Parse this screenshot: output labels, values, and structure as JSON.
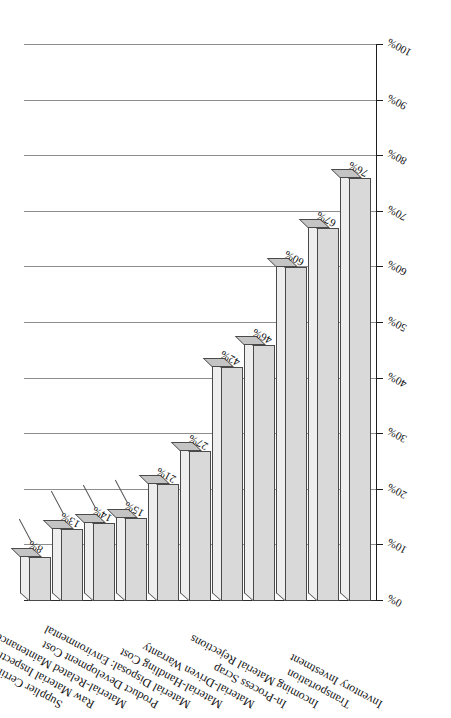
{
  "chart_data": {
    "type": "bar",
    "orientation": "horizontal-3d",
    "title": "",
    "xlabel": "",
    "ylabel": "Percentage Answering Yes",
    "ylim": [
      0,
      100
    ],
    "grid": true,
    "legend": "none",
    "tick_labels": [
      "0%",
      "10%",
      "20%",
      "30%",
      "40%",
      "50%",
      "60%",
      "70%",
      "80%",
      "90%",
      "100%"
    ],
    "tick_values": [
      0,
      10,
      20,
      30,
      40,
      50,
      60,
      70,
      80,
      90,
      100
    ],
    "categories": [
      "Inventory Investment",
      "Transportation",
      "Incoming Material Rejections",
      "In-Process Scrap",
      "Material-Driven Warranty",
      "Material-Handling Cost",
      "Material Disposal: Environmental",
      "Product Development Cost",
      "Material-Related Maintenance",
      "Raw Material Inspection",
      "Supplier Certification Cost"
    ],
    "values": [
      76,
      67,
      60,
      46,
      42,
      27,
      21,
      15,
      14,
      13,
      8
    ],
    "value_labels": [
      "76%",
      "67%",
      "60%",
      "46%",
      "42%",
      "27%",
      "21%",
      "15%",
      "14%",
      "13%",
      "8%"
    ],
    "colors": {
      "bar_face": "#d9d9d9",
      "bar_top": "#eeeeee",
      "bar_end": "#c4c4c4",
      "bar_outline": "#4a4a4a",
      "gridline": "#8d8d8d",
      "axis": "#1d1d1d",
      "text": "#111111",
      "background": "#ffffff"
    }
  }
}
